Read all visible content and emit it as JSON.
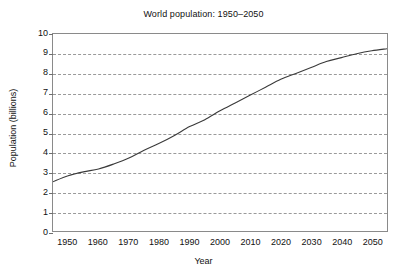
{
  "chart_data": {
    "type": "line",
    "title": "World population: 1950–2050",
    "xlabel": "Year",
    "ylabel": "Population (billions)",
    "xlim": [
      1945,
      2055
    ],
    "ylim": [
      0,
      10
    ],
    "grid": true,
    "legend": false,
    "x_ticks": [
      1950,
      1960,
      1970,
      1980,
      1990,
      2000,
      2010,
      2020,
      2030,
      2040,
      2050
    ],
    "y_ticks": [
      0,
      1,
      2,
      3,
      4,
      5,
      6,
      7,
      8,
      9,
      10
    ],
    "gridline_values": [
      1,
      2,
      3,
      4,
      5,
      6,
      7,
      8,
      9
    ],
    "series": [
      {
        "name": "World population",
        "color": "#3a3a3a",
        "x": [
          1945,
          1950,
          1955,
          1960,
          1965,
          1970,
          1975,
          1980,
          1985,
          1990,
          1995,
          2000,
          2005,
          2010,
          2015,
          2020,
          2025,
          2030,
          2035,
          2040,
          2045,
          2050,
          2055
        ],
        "values": [
          2.5,
          2.8,
          3.0,
          3.15,
          3.4,
          3.7,
          4.1,
          4.45,
          4.85,
          5.3,
          5.65,
          6.1,
          6.5,
          6.9,
          7.3,
          7.7,
          8.0,
          8.3,
          8.6,
          8.8,
          9.0,
          9.15,
          9.25
        ]
      }
    ]
  },
  "axis": {
    "y_tick_labels": [
      "10",
      "9",
      "8",
      "7",
      "6",
      "5",
      "4",
      "3",
      "2",
      "1",
      "0"
    ],
    "x_tick_labels": [
      "1950",
      "1960",
      "1970",
      "1980",
      "1990",
      "2000",
      "2010",
      "2020",
      "2030",
      "2040",
      "2050"
    ]
  },
  "colors": {
    "line": "#3a3a3a",
    "grid": "#9a9a9a",
    "frame": "#8a8a8a",
    "text": "#111111",
    "background": "#ffffff"
  }
}
